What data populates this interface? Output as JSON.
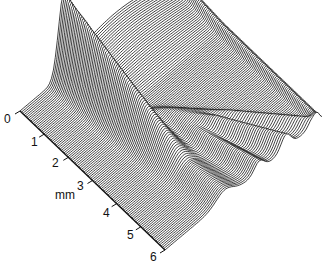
{
  "chart_data": {
    "type": "area",
    "subtype": "3d-waterfall",
    "title": "",
    "xlabel": "",
    "ylabel": "",
    "depth_axis": {
      "label": "mm",
      "ticks": [
        "0",
        "1",
        "2",
        "3",
        "4",
        "5",
        "6"
      ],
      "range": [
        0,
        6
      ]
    },
    "grid": false,
    "legend": null,
    "features": [
      {
        "name": "main-ridge",
        "start_mm": 0,
        "relative_height": 1.0
      },
      {
        "name": "branch-ridge-1",
        "start_mm": 2.5,
        "relative_height": 0.45
      },
      {
        "name": "branch-ridge-2",
        "start_mm": 3.0,
        "relative_height": 0.35
      },
      {
        "name": "branch-ridge-3",
        "start_mm": 3.5,
        "relative_height": 0.3
      }
    ],
    "colors": {
      "line": "#111111",
      "background": "#ffffff"
    }
  },
  "axis": {
    "unit": "mm",
    "ticks": [
      "0",
      "1",
      "2",
      "3",
      "4",
      "5",
      "6"
    ]
  }
}
